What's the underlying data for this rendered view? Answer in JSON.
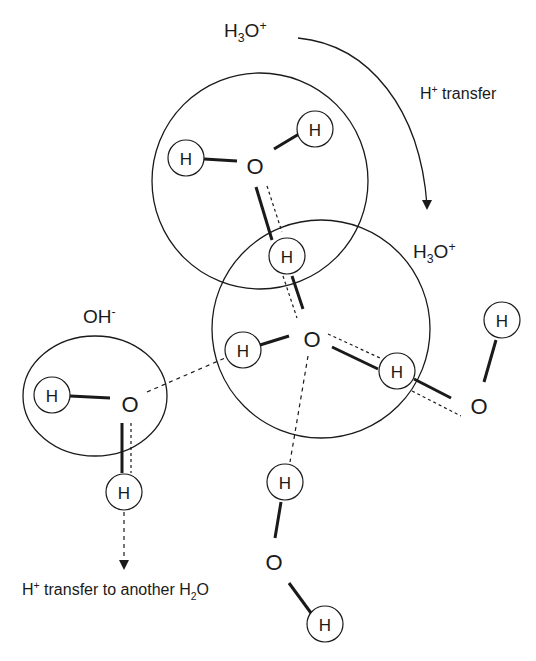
{
  "labels": {
    "top_species": {
      "base": "H",
      "sub": "3",
      "mid": "O",
      "sup": "+"
    },
    "transfer_top": {
      "base": "H",
      "sup": "+",
      "rest": " transfer"
    },
    "middle_species": {
      "base": "H",
      "sub": "3",
      "mid": "O",
      "sup": "+"
    },
    "left_species": {
      "base": "OH",
      "sup": "-"
    },
    "bottom_transfer": {
      "base": "H",
      "sup": "+",
      "rest": " transfer to another H",
      "sub": "2",
      "tail": "O"
    }
  },
  "atoms": {
    "hydrogen": "H",
    "oxygen": "O"
  },
  "colors": {
    "stroke": "#1a1a1a",
    "background": "#ffffff"
  }
}
